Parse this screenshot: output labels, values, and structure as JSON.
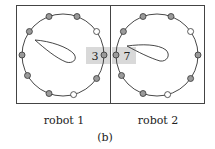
{
  "figure": {
    "caption": "(b)",
    "panels": [
      {
        "label": "robot 1",
        "highlighted_node_number": "3",
        "nodes": [
          {
            "angle": -110,
            "fill": "gray"
          },
          {
            "angle": -145,
            "fill": "gray"
          },
          {
            "angle": -70,
            "fill": "gray"
          },
          {
            "angle": -35,
            "fill": "white"
          },
          {
            "angle": 0,
            "fill": "gray",
            "highlighted": true
          },
          {
            "angle": 35,
            "fill": "gray"
          },
          {
            "angle": 75,
            "fill": "white"
          },
          {
            "angle": 110,
            "fill": "gray"
          },
          {
            "angle": 150,
            "fill": "gray"
          },
          {
            "angle": 180,
            "fill": "gray"
          }
        ]
      },
      {
        "label": "robot 2",
        "highlighted_node_number": "7",
        "nodes": [
          {
            "angle": -110,
            "fill": "gray"
          },
          {
            "angle": -145,
            "fill": "gray"
          },
          {
            "angle": -70,
            "fill": "gray"
          },
          {
            "angle": -35,
            "fill": "white"
          },
          {
            "angle": 0,
            "fill": "gray"
          },
          {
            "angle": 35,
            "fill": "gray"
          },
          {
            "angle": 75,
            "fill": "white"
          },
          {
            "angle": 110,
            "fill": "gray"
          },
          {
            "angle": 150,
            "fill": "gray"
          },
          {
            "angle": 180,
            "fill": "gray",
            "highlighted": true
          }
        ]
      }
    ],
    "colors": {
      "frame": "#444444",
      "node_gray": "#9a9a9a",
      "node_white": "#ffffff",
      "highlight_box": "#d9d9d9"
    }
  }
}
